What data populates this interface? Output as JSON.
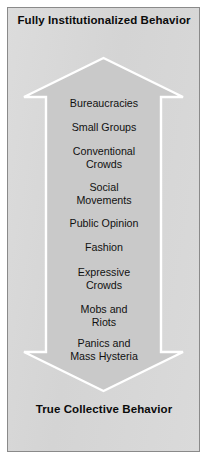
{
  "figure": {
    "title_top": {
      "lines": [
        "Fully",
        "Institutionalized",
        "Behavior"
      ]
    },
    "title_bottom": {
      "lines": [
        "True",
        "Collective",
        "Behavior"
      ]
    },
    "arrow": {
      "direction": "double-vertical",
      "fill_color": "#c9c9c9",
      "outline_color": "#ffffff",
      "background_color": "#d9d9d9",
      "border_color": "#8a8a8a"
    },
    "stages": [
      {
        "lines": [
          "Bureaucracies"
        ]
      },
      {
        "lines": [
          "Small Groups"
        ]
      },
      {
        "lines": [
          "Conventional",
          "Crowds"
        ]
      },
      {
        "lines": [
          "Social",
          "Movements"
        ]
      },
      {
        "lines": [
          "Public Opinion"
        ]
      },
      {
        "lines": [
          "Fashion"
        ]
      },
      {
        "lines": [
          "Expressive",
          "Crowds"
        ]
      },
      {
        "lines": [
          "Mobs and",
          "Riots"
        ]
      },
      {
        "lines": [
          "Panics and",
          "Mass Hysteria"
        ]
      }
    ]
  }
}
